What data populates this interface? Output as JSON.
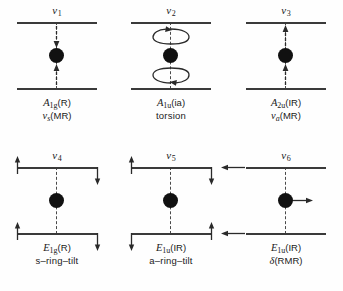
{
  "figure": {
    "background_color": "#fefefe",
    "line_color": "#3a3a3a",
    "atom_color": "#111111"
  },
  "modes": [
    {
      "id": "nu1",
      "label_nu": "ν",
      "label_index": "1",
      "symmetry_letter": "A",
      "symmetry_sub": "1g",
      "activity": "(R)",
      "description_nu": "ν",
      "description_sub": "s",
      "description_rest": "(MR)",
      "motion": "symmetric-metal-ring-stretch",
      "arrow_style": "axial-inward"
    },
    {
      "id": "nu2",
      "label_nu": "ν",
      "label_index": "2",
      "symmetry_letter": "A",
      "symmetry_sub": "1u",
      "activity": "(ia)",
      "description_plain": "torsion",
      "motion": "ring-torsion",
      "arrow_style": "rotation-loops"
    },
    {
      "id": "nu3",
      "label_nu": "ν",
      "label_index": "3",
      "symmetry_letter": "A",
      "symmetry_sub": "2u",
      "activity": "(IR)",
      "description_nu": "ν",
      "description_sub": "a",
      "description_rest": "(MR)",
      "motion": "antisymmetric-metal-ring-stretch",
      "arrow_style": "axial-both-up"
    },
    {
      "id": "nu4",
      "label_nu": "ν",
      "label_index": "4",
      "symmetry_letter": "E",
      "symmetry_sub": "1g",
      "activity": "(R)",
      "description_plain": "s–ring–tilt",
      "motion": "symmetric-ring-tilt",
      "arrow_style": "tilt-symmetric"
    },
    {
      "id": "nu5",
      "label_nu": "ν",
      "label_index": "5",
      "symmetry_letter": "E",
      "symmetry_sub": "1u",
      "activity": "(IR)",
      "description_plain": "a–ring–tilt",
      "motion": "antisymmetric-ring-tilt",
      "arrow_style": "tilt-antisymmetric"
    },
    {
      "id": "nu6",
      "label_nu": "ν",
      "label_index": "6",
      "symmetry_letter": "E",
      "symmetry_sub": "1u",
      "activity": "(IR)",
      "description_delta": "δ",
      "description_rest": "(RMR)",
      "motion": "ring-metal-ring-bend",
      "arrow_style": "lateral-bend"
    }
  ]
}
